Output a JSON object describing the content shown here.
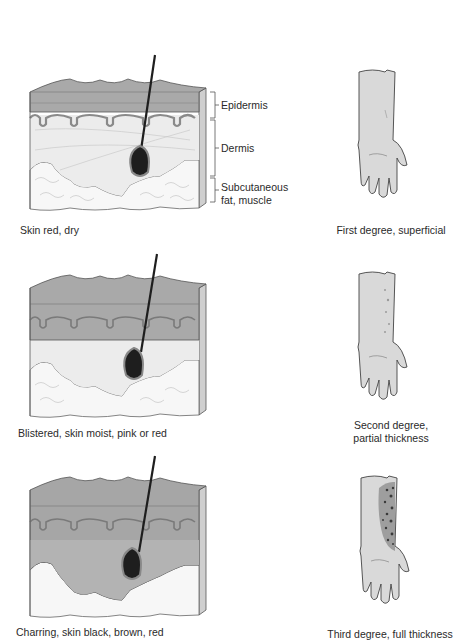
{
  "figure": {
    "layer_labels": {
      "epidermis": "Epidermis",
      "dermis": "Dermis",
      "subcutaneous_line1": "Subcutaneous",
      "subcutaneous_line2": "fat, muscle"
    },
    "rows": [
      {
        "degree": "first",
        "skin_caption": "Skin red, dry",
        "arm_caption_line1": "First degree, superficial",
        "arm_caption_line2": ""
      },
      {
        "degree": "second",
        "skin_caption": "Blistered, skin moist, pink or red",
        "arm_caption_line1": "Second degree,",
        "arm_caption_line2": "partial thickness"
      },
      {
        "degree": "third",
        "skin_caption": "Charring, skin black, brown, red",
        "arm_caption_line1": "Third degree, full thickness",
        "arm_caption_line2": ""
      }
    ],
    "colors": {
      "epidermis": "#a9a9a9",
      "epidermis_top": "#b8b8b8",
      "dermis": "#ececec",
      "fat": "#f7f7f7",
      "burned_dark": "#9a9a9a",
      "burned_mid": "#b3b3b3",
      "hair": "#1e1e1e",
      "arm": "#d9d9d9",
      "outline": "#555555",
      "char": "#3a3a3a"
    }
  }
}
